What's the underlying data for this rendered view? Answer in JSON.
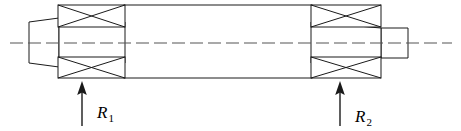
{
  "figure": {
    "name": "shaft-bearing-free-body-diagram",
    "background_color": "#ffffff",
    "line_color": "#1a1a1a",
    "width": 461,
    "height": 131
  },
  "centerline": {
    "name": "axis-centerline",
    "style": "dash-dot",
    "y": 43,
    "x_start": 10,
    "x_end": 452
  },
  "shaft": {
    "left_stub": {
      "label": "left-shaft-stub",
      "x1": 29,
      "x2": 59,
      "y_top": 22,
      "y_bottom": 63
    },
    "main_body": {
      "label": "main-shaft-body",
      "x1": 124,
      "x2": 312,
      "y_top": 5,
      "y_bottom": 78
    },
    "right_stub": {
      "label": "right-shaft-stub",
      "x1": 381,
      "x2": 408,
      "y_top": 28,
      "y_bottom": 58
    }
  },
  "bearings": [
    {
      "name": "bearing-left-upper",
      "x1": 58,
      "x2": 125,
      "y_top": 5,
      "y_bottom": 27
    },
    {
      "name": "bearing-left-lower",
      "x1": 58,
      "x2": 125,
      "y_top": 57,
      "y_bottom": 78
    },
    {
      "name": "bearing-right-upper",
      "x1": 311,
      "x2": 381,
      "y_top": 5,
      "y_bottom": 27
    },
    {
      "name": "bearing-right-lower",
      "x1": 311,
      "x2": 381,
      "y_top": 57,
      "y_bottom": 78
    }
  ],
  "reactions": [
    {
      "id": "R1",
      "symbol": "R",
      "subscript": "1",
      "arrow_x": 82,
      "arrow_tail_y": 126,
      "arrow_head_y": 82,
      "label_x": 97,
      "label_y": 118,
      "direction": "up"
    },
    {
      "id": "R2",
      "symbol": "R",
      "subscript": "2",
      "arrow_x": 340,
      "arrow_tail_y": 126,
      "arrow_head_y": 82,
      "label_x": 355,
      "label_y": 122,
      "direction": "up"
    }
  ]
}
